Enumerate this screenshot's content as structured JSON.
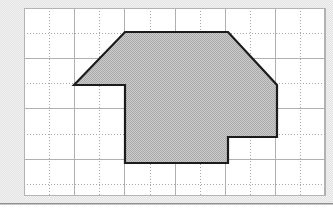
{
  "figure": {
    "kind": "geometry-figure",
    "background_color": "#f2f2f2",
    "grid": {
      "panel_color": "#ffffff",
      "line_color": "#a8a8a8",
      "border_color": "#b4b4b4",
      "cell_size_px": 25.1,
      "columns": 12,
      "rows": 7.5,
      "origin_px": {
        "x": 24,
        "y": 8
      },
      "size_px": {
        "width": 301,
        "height": 188
      },
      "style": "dotted-minor-with-solid-major",
      "major_every": 2
    },
    "polygon": {
      "name": "shaded-polygon",
      "fill_color": "#bdbdbd",
      "fill_pattern": "dithered-gray-halftone",
      "stroke_color": "#1c1c1c",
      "stroke_width_px": 2.2,
      "vertex_count": 10,
      "vertices_grid": [
        [
          2,
          3
        ],
        [
          4,
          1
        ],
        [
          8,
          1
        ],
        [
          10,
          3
        ],
        [
          10,
          5
        ],
        [
          8,
          5
        ],
        [
          8,
          6
        ],
        [
          4,
          6
        ],
        [
          4,
          3
        ],
        [
          2,
          3
        ]
      ],
      "vertices_px": [
        [
          74,
          85
        ],
        [
          125,
          32
        ],
        [
          228,
          32
        ],
        [
          277,
          85
        ],
        [
          277,
          137
        ],
        [
          228,
          137
        ],
        [
          228,
          163
        ],
        [
          125,
          163
        ],
        [
          125,
          85
        ],
        [
          74,
          85
        ]
      ],
      "edges": [
        {
          "from": 0,
          "to": 1,
          "type": "diagonal"
        },
        {
          "from": 1,
          "to": 2,
          "type": "horizontal"
        },
        {
          "from": 2,
          "to": 3,
          "type": "diagonal"
        },
        {
          "from": 3,
          "to": 4,
          "type": "vertical"
        },
        {
          "from": 4,
          "to": 5,
          "type": "horizontal"
        },
        {
          "from": 5,
          "to": 6,
          "type": "vertical"
        },
        {
          "from": 6,
          "to": 7,
          "type": "horizontal"
        },
        {
          "from": 7,
          "to": 8,
          "type": "vertical"
        },
        {
          "from": 8,
          "to": 9,
          "type": "horizontal"
        }
      ]
    },
    "footer_rule": {
      "color": "#8e8e8e",
      "y_px": 203
    }
  }
}
